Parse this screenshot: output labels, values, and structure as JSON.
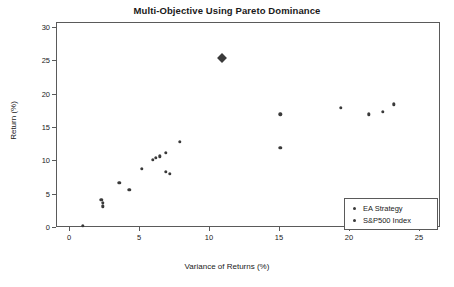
{
  "chart_data": {
    "type": "scatter",
    "title": "Multi-Objective Using Pareto Dominance",
    "xlabel": "Variance of Returns (%)",
    "ylabel": "Return (%)",
    "xlim": [
      0,
      26.5
    ],
    "ylim": [
      0,
      30
    ],
    "xticks": [
      0,
      5,
      10,
      15,
      20,
      25
    ],
    "yticks": [
      0,
      5,
      10,
      15,
      20,
      25,
      30
    ],
    "grid": false,
    "legend_position": "bottom-right",
    "series": [
      {
        "name": "EA Strategy",
        "marker": "circle",
        "color": "#3a3a3a",
        "points": [
          {
            "x": 1.0,
            "y": 0.2
          },
          {
            "x": 2.3,
            "y": 4.1
          },
          {
            "x": 2.4,
            "y": 3.6
          },
          {
            "x": 2.4,
            "y": 3.1
          },
          {
            "x": 3.6,
            "y": 6.6
          },
          {
            "x": 4.3,
            "y": 5.6
          },
          {
            "x": 5.2,
            "y": 8.7
          },
          {
            "x": 6.0,
            "y": 10.1
          },
          {
            "x": 6.2,
            "y": 10.4
          },
          {
            "x": 6.5,
            "y": 10.6
          },
          {
            "x": 6.9,
            "y": 8.3
          },
          {
            "x": 7.2,
            "y": 8.0
          },
          {
            "x": 6.9,
            "y": 11.1
          },
          {
            "x": 7.9,
            "y": 12.8
          },
          {
            "x": 15.1,
            "y": 11.9
          },
          {
            "x": 15.1,
            "y": 16.9
          },
          {
            "x": 19.4,
            "y": 17.9
          },
          {
            "x": 21.4,
            "y": 16.9
          },
          {
            "x": 22.4,
            "y": 17.3
          },
          {
            "x": 23.2,
            "y": 18.4
          }
        ]
      },
      {
        "name": "S&P500 Index",
        "marker": "diamond",
        "color": "#3a3a3a",
        "points": [
          {
            "x": 10.9,
            "y": 25.3
          }
        ]
      }
    ]
  },
  "legend": {
    "entries": [
      {
        "label": "EA Strategy"
      },
      {
        "label": "S&P500 Index"
      }
    ]
  }
}
